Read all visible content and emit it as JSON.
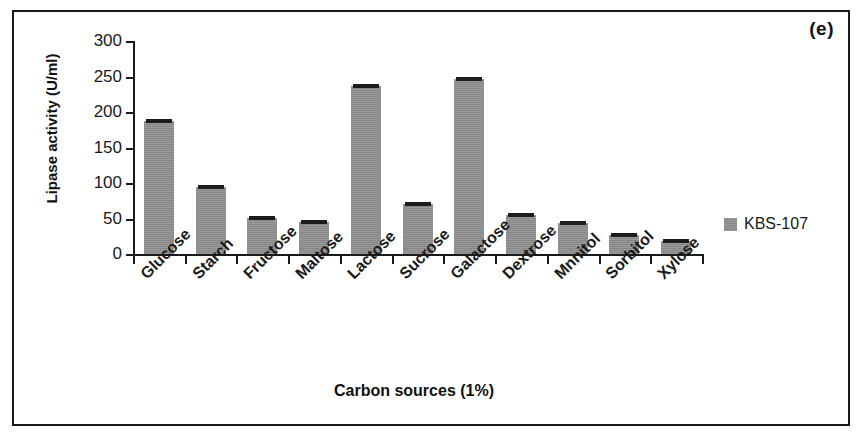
{
  "panel": {
    "label": "(e)"
  },
  "chart_data": {
    "type": "bar",
    "title": "",
    "xlabel": "Carbon sources (1%)",
    "ylabel": "Lipase activity (U/ml)",
    "categories": [
      "Glucose",
      "Starch",
      "Fructose",
      "Maltose",
      "Lactose",
      "Sucrose",
      "Galactose",
      "Dextrose",
      "Mnnitol",
      "Sorbitol",
      "Xylose"
    ],
    "series": [
      {
        "name": "KBS-107",
        "values": [
          188,
          94,
          51,
          45,
          237,
          70,
          247,
          55,
          43,
          27,
          19
        ],
        "color": "#8e8e8e"
      }
    ],
    "errorbars": true,
    "ylim": [
      0,
      300
    ],
    "yticks": [
      0,
      50,
      100,
      150,
      200,
      250,
      300
    ],
    "ytick_labels": [
      "0",
      "50",
      "100",
      "150",
      "200",
      "250",
      "300"
    ],
    "grid": false,
    "legend_position": "right",
    "legend_entries": [
      "KBS-107"
    ]
  },
  "legend": {
    "swatch_color": "#8e8e8e",
    "label": "KBS-107"
  },
  "axes": {
    "x_title": "Carbon sources (1%)",
    "y_title": "Lipase activity (U/ml)"
  },
  "colors": {
    "bar": "#8e8e8e",
    "axis": "#1a1a1a",
    "errorbar": "#1c1c1c",
    "frame": "#1a1a1a",
    "text": "#111111"
  }
}
